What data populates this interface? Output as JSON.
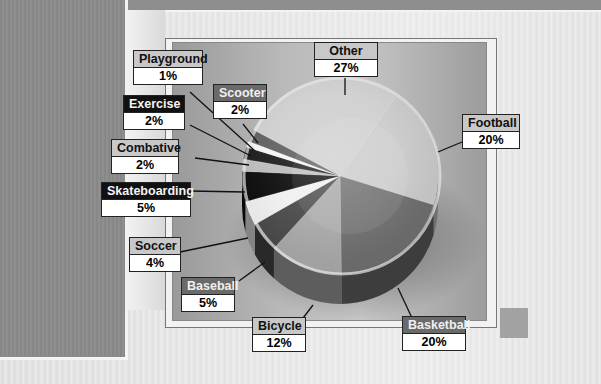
{
  "chart_data": {
    "type": "pie",
    "title": "",
    "style": "3d-grayscale",
    "categories": [
      "Other",
      "Football",
      "Basketball",
      "Bicycle",
      "Baseball",
      "Soccer",
      "Skateboarding",
      "Combative",
      "Exercise",
      "Playground",
      "Scooter"
    ],
    "values": [
      27,
      20,
      20,
      12,
      5,
      4,
      5,
      2,
      2,
      1,
      2
    ],
    "unit": "%",
    "labels": [
      {
        "name": "Other",
        "value": "27%"
      },
      {
        "name": "Football",
        "value": "20%"
      },
      {
        "name": "Basketball",
        "value": "20%"
      },
      {
        "name": "Bicycle",
        "value": "12%"
      },
      {
        "name": "Baseball",
        "value": "5%"
      },
      {
        "name": "Soccer",
        "value": "4%"
      },
      {
        "name": "Skateboarding",
        "value": "5%"
      },
      {
        "name": "Combative",
        "value": "2%"
      },
      {
        "name": "Exercise",
        "value": "2%"
      },
      {
        "name": "Playground",
        "value": "1%"
      },
      {
        "name": "Scooter",
        "value": "2%"
      }
    ],
    "legend": "callout boxes with leader lines"
  },
  "labels": {
    "other": {
      "name": "Other",
      "value": "27%"
    },
    "football": {
      "name": "Football",
      "value": "20%"
    },
    "basketball": {
      "name": "Basketball",
      "value": "20%"
    },
    "bicycle": {
      "name": "Bicycle",
      "value": "12%"
    },
    "baseball": {
      "name": "Baseball",
      "value": "5%"
    },
    "soccer": {
      "name": "Soccer",
      "value": "4%"
    },
    "skateboarding": {
      "name": "Skateboarding",
      "value": "5%"
    },
    "combative": {
      "name": "Combative",
      "value": "2%"
    },
    "exercise": {
      "name": "Exercise",
      "value": "2%"
    },
    "playground": {
      "name": "Playground",
      "value": "1%"
    },
    "scooter": {
      "name": "Scooter",
      "value": "2%"
    }
  },
  "colors": {
    "other": "#cfcfcf",
    "football": "#cbcbcb",
    "basketball": "#6f6f6f",
    "bicycle": "#a9a9a9",
    "baseball": "#4a4a4a",
    "soccer": "#f0f0f0",
    "skateboarding": "#0c0c0c",
    "combative": "#bdbdbd",
    "exercise": "#1c1c1c",
    "playground": "#f5f5f5",
    "scooter": "#606060"
  }
}
